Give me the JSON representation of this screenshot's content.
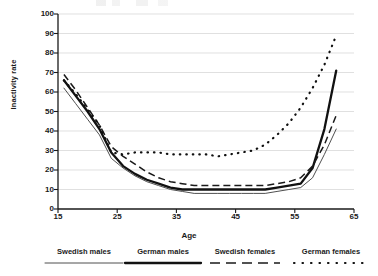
{
  "chart_data": {
    "type": "line",
    "title": "",
    "xlabel": "Age",
    "ylabel": "Inactivity rate",
    "xlim": [
      15,
      65
    ],
    "ylim": [
      0,
      100
    ],
    "xticks": [
      15,
      25,
      35,
      45,
      55,
      65
    ],
    "yticks": [
      0,
      10,
      20,
      30,
      40,
      50,
      60,
      70,
      80,
      90,
      100
    ],
    "grid": true,
    "legend_position": "bottom",
    "x": [
      16,
      18,
      20,
      22,
      24,
      26,
      28,
      30,
      32,
      34,
      36,
      38,
      40,
      42,
      44,
      46,
      48,
      50,
      52,
      54,
      56,
      58,
      60,
      62
    ],
    "series": [
      {
        "name": "Swedish males",
        "style": "thin-solid",
        "color": "#4f4f4f",
        "values": [
          62,
          54,
          46,
          38,
          26,
          21,
          17,
          14,
          12,
          10,
          9,
          8,
          8,
          8,
          8,
          8,
          8,
          8,
          9,
          10,
          11,
          16,
          28,
          41
        ]
      },
      {
        "name": "German males",
        "style": "thick-solid",
        "color": "#111111",
        "values": [
          66,
          58,
          50,
          41,
          29,
          22,
          18,
          15,
          13,
          11,
          10,
          10,
          10,
          10,
          10,
          10,
          10,
          10,
          11,
          12,
          13,
          21,
          41,
          71
        ]
      },
      {
        "name": "Swedish females",
        "style": "dashed",
        "color": "#1a1a1a",
        "values": [
          69,
          61,
          52,
          43,
          32,
          27,
          23,
          19,
          16,
          14,
          13,
          12,
          12,
          12,
          12,
          12,
          12,
          12,
          13,
          14,
          16,
          22,
          33,
          48
        ]
      },
      {
        "name": "German females",
        "style": "dotted",
        "color": "#111111",
        "values": [
          66,
          59,
          51,
          43,
          29,
          28,
          29,
          29,
          29,
          28,
          28,
          28,
          28,
          27,
          28,
          29,
          30,
          33,
          38,
          44,
          52,
          62,
          74,
          89
        ]
      }
    ]
  },
  "legend": {
    "items": [
      {
        "label": "Swedish males",
        "key": "thin-solid"
      },
      {
        "label": "German males",
        "key": "thick-solid"
      },
      {
        "label": "Swedish females",
        "key": "dashed"
      },
      {
        "label": "German females",
        "key": "dotted"
      }
    ]
  }
}
